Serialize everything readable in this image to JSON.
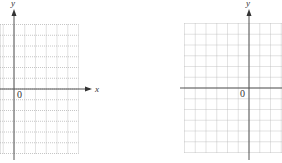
{
  "graphs": [
    {
      "name": "left-coordinate-grid",
      "x_axis_label": "x",
      "y_axis_label": "y",
      "origin_label": "0",
      "grid_cols_right_of_y_axis": 6,
      "grid_rows_above_x_axis": 6,
      "grid_rows_below_x_axis": 6
    },
    {
      "name": "right-coordinate-grid",
      "y_axis_label": "y",
      "origin_label": "0",
      "grid_cols_left_of_y_axis": 6,
      "grid_rows_above_x_axis": 6,
      "grid_rows_below_x_axis": 6
    }
  ],
  "colors": {
    "grid": "#b8b8b8",
    "axis": "#555555",
    "text": "#333333",
    "background": "#ffffff"
  }
}
